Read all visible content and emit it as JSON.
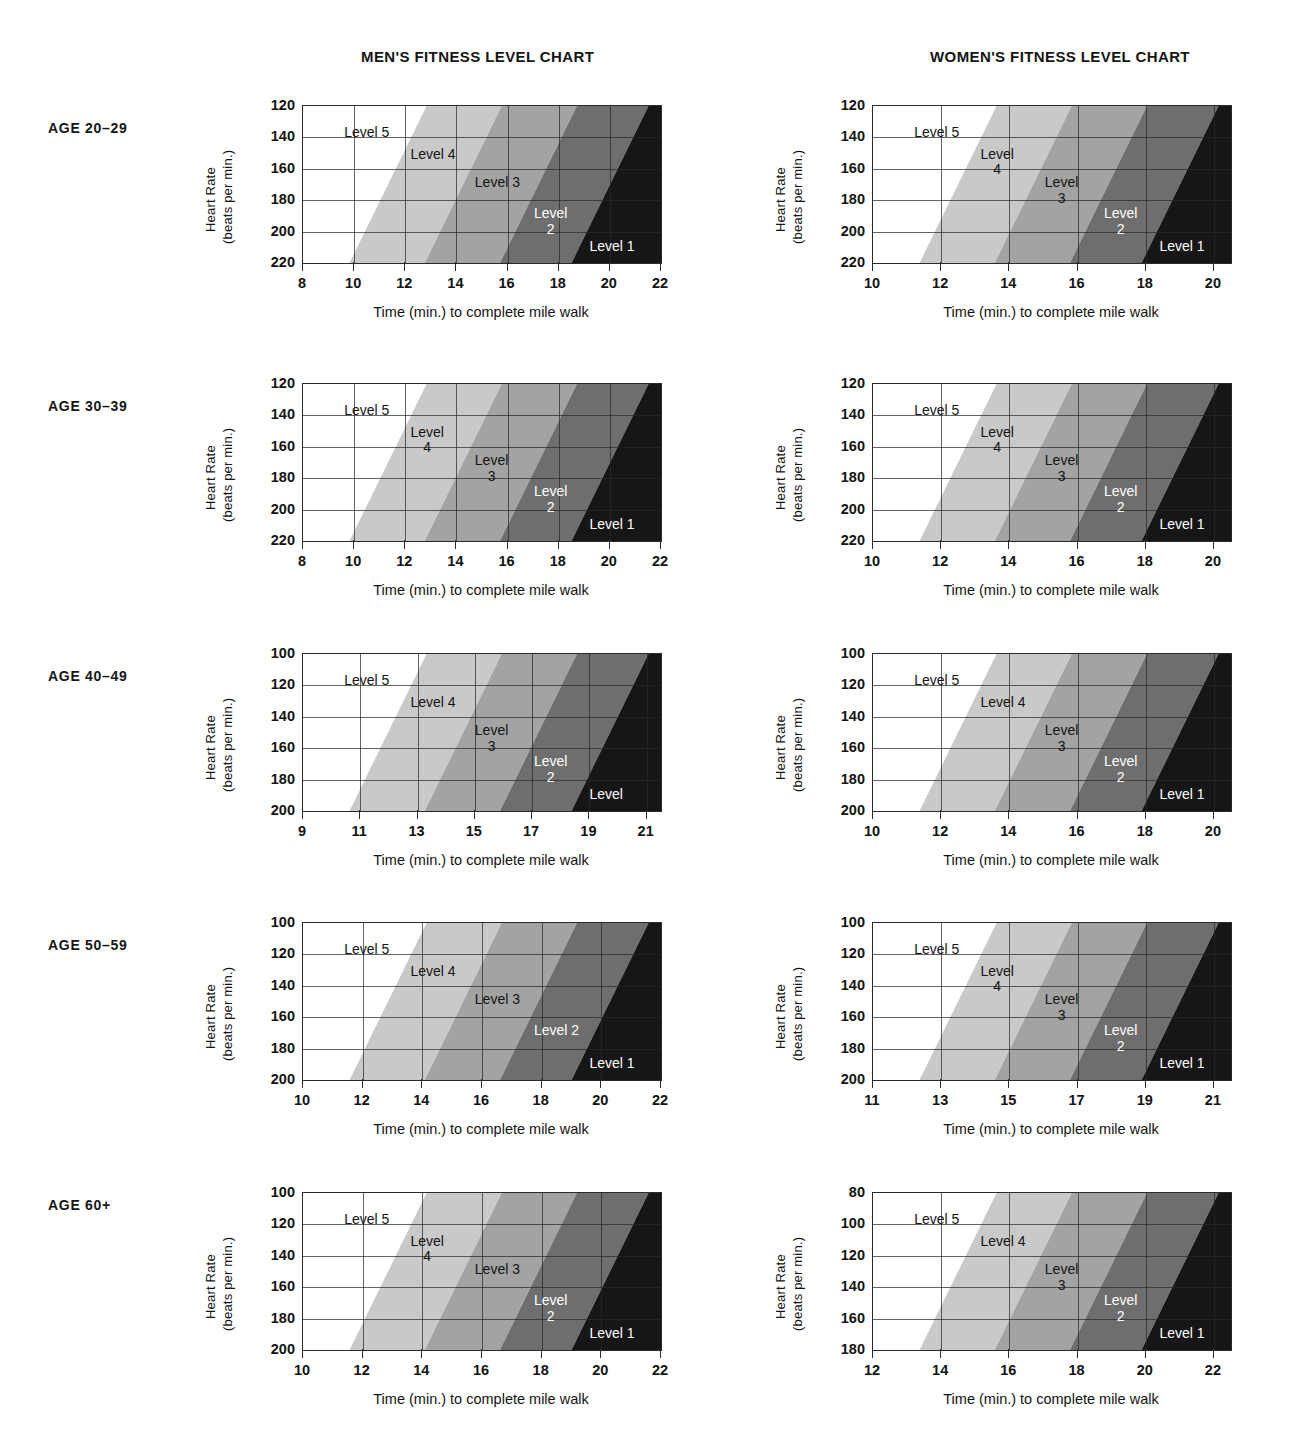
{
  "headers": {
    "men": "MEN'S FITNESS LEVEL CHART",
    "women": "WOMEN'S FITNESS LEVEL CHART"
  },
  "axis_titles": {
    "x": "Time (min.) to complete mile walk",
    "y_line1": "Heart Rate",
    "y_line2": "(beats per min.)"
  },
  "colors": {
    "level5": "#ffffff",
    "level4": "#c9c9c9",
    "level3": "#a3a3a3",
    "level2": "#6e6e6e",
    "level1": "#161616",
    "grid": "#2a2a2a",
    "text": "#131313"
  },
  "age_groups": [
    {
      "id": "age-20-29",
      "label": "AGE 20–29"
    },
    {
      "id": "age-30-39",
      "label": "AGE 30–39"
    },
    {
      "id": "age-40-49",
      "label": "AGE 40–49"
    },
    {
      "id": "age-50-59",
      "label": "AGE 50–59"
    },
    {
      "id": "age-60-plus",
      "label": "AGE 60+"
    }
  ],
  "level_labels": {
    "l5": "Level 5",
    "l4": "Level 4",
    "l3": "Level 3",
    "l2": "Level 2",
    "l1": "Level 1",
    "level_word": "Level",
    "n4": "4",
    "n3": "3",
    "n2": "2"
  },
  "chart_data": {
    "type": "area",
    "xlabel": "Time (min.) to complete mile walk",
    "ylabel": "Heart Rate (beats per min.)",
    "grid": true,
    "legend": "none",
    "band_order_left_to_right": [
      "Level 5",
      "Level 4",
      "Level 3",
      "Level 2",
      "Level 1"
    ],
    "band_colors": [
      "#ffffff",
      "#c9c9c9",
      "#a3a3a3",
      "#6e6e6e",
      "#161616"
    ],
    "charts": [
      {
        "sex": "men",
        "age_group": "AGE 20–29",
        "xticks": [
          8,
          10,
          12,
          14,
          16,
          18,
          20,
          22
        ],
        "xlim": [
          8,
          22
        ],
        "yticks": [
          120,
          140,
          160,
          180,
          200,
          220
        ],
        "ylim": [
          120,
          220
        ],
        "y_inverted": true,
        "labels": [
          {
            "text": "Level 5",
            "style": "one-line",
            "color": "dark"
          },
          {
            "text": "Level 4",
            "style": "one-line",
            "color": "dark"
          },
          {
            "text": "Level 3",
            "style": "one-line",
            "color": "dark"
          },
          {
            "text": "Level 2",
            "style": "two-line",
            "color": "light"
          },
          {
            "text": "Level 1",
            "style": "one-line",
            "color": "light"
          }
        ]
      },
      {
        "sex": "women",
        "age_group": "AGE 20–29",
        "xticks": [
          10,
          12,
          14,
          16,
          18,
          20
        ],
        "xlim": [
          10,
          20.5
        ],
        "yticks": [
          120,
          140,
          160,
          180,
          200,
          220
        ],
        "ylim": [
          120,
          220
        ],
        "y_inverted": true,
        "labels": [
          {
            "text": "Level 5",
            "style": "one-line",
            "color": "dark"
          },
          {
            "text": "Level 4",
            "style": "two-line",
            "color": "dark"
          },
          {
            "text": "Level 3",
            "style": "two-line",
            "color": "dark"
          },
          {
            "text": "Level 2",
            "style": "two-line",
            "color": "light"
          },
          {
            "text": "Level 1",
            "style": "one-line",
            "color": "light"
          }
        ]
      },
      {
        "sex": "men",
        "age_group": "AGE 30–39",
        "xticks": [
          8,
          10,
          12,
          14,
          16,
          18,
          20,
          22
        ],
        "xlim": [
          8,
          22
        ],
        "yticks": [
          120,
          140,
          160,
          180,
          200,
          220
        ],
        "ylim": [
          120,
          220
        ],
        "y_inverted": true,
        "labels": [
          {
            "text": "Level 5",
            "style": "one-line",
            "color": "dark"
          },
          {
            "text": "Level 4",
            "style": "two-line",
            "color": "dark"
          },
          {
            "text": "Level 3",
            "style": "two-line",
            "color": "dark"
          },
          {
            "text": "Level 2",
            "style": "two-line",
            "color": "light"
          },
          {
            "text": "Level 1",
            "style": "one-line",
            "color": "light"
          }
        ]
      },
      {
        "sex": "women",
        "age_group": "AGE 30–39",
        "xticks": [
          10,
          12,
          14,
          16,
          18,
          20
        ],
        "xlim": [
          10,
          20.5
        ],
        "yticks": [
          120,
          140,
          160,
          180,
          200,
          220
        ],
        "ylim": [
          120,
          220
        ],
        "y_inverted": true,
        "labels": [
          {
            "text": "Level 5",
            "style": "one-line",
            "color": "dark"
          },
          {
            "text": "Level 4",
            "style": "two-line",
            "color": "dark"
          },
          {
            "text": "Level 3",
            "style": "two-line",
            "color": "dark"
          },
          {
            "text": "Level 2",
            "style": "two-line",
            "color": "light"
          },
          {
            "text": "Level 1",
            "style": "one-line",
            "color": "light"
          }
        ]
      },
      {
        "sex": "men",
        "age_group": "AGE 40–49",
        "xticks": [
          9,
          11,
          13,
          15,
          17,
          19,
          21
        ],
        "xlim": [
          9,
          21.5
        ],
        "yticks": [
          100,
          120,
          140,
          160,
          180,
          200
        ],
        "ylim": [
          100,
          200
        ],
        "y_inverted": true,
        "labels": [
          {
            "text": "Level 5",
            "style": "one-line",
            "color": "dark"
          },
          {
            "text": "Level 4",
            "style": "one-line",
            "color": "dark"
          },
          {
            "text": "Level 3",
            "style": "two-line",
            "color": "dark"
          },
          {
            "text": "Level 2",
            "style": "two-line",
            "color": "light"
          },
          {
            "text": "Level",
            "style": "one-line",
            "color": "light"
          }
        ]
      },
      {
        "sex": "women",
        "age_group": "AGE 40–49",
        "xticks": [
          10,
          12,
          14,
          16,
          18,
          20
        ],
        "xlim": [
          10,
          20.5
        ],
        "yticks": [
          100,
          120,
          140,
          160,
          180,
          200
        ],
        "ylim": [
          100,
          200
        ],
        "y_inverted": true,
        "labels": [
          {
            "text": "Level 5",
            "style": "one-line",
            "color": "dark"
          },
          {
            "text": "Level 4",
            "style": "one-line",
            "color": "dark"
          },
          {
            "text": "Level 3",
            "style": "two-line",
            "color": "dark"
          },
          {
            "text": "Level 2",
            "style": "two-line",
            "color": "light"
          },
          {
            "text": "Level 1",
            "style": "one-line",
            "color": "light"
          }
        ]
      },
      {
        "sex": "men",
        "age_group": "AGE 50–59",
        "xticks": [
          10,
          12,
          14,
          16,
          18,
          20,
          22
        ],
        "xlim": [
          10,
          22
        ],
        "yticks": [
          100,
          120,
          140,
          160,
          180,
          200
        ],
        "ylim": [
          100,
          200
        ],
        "y_inverted": true,
        "labels": [
          {
            "text": "Level 5",
            "style": "one-line",
            "color": "dark"
          },
          {
            "text": "Level 4",
            "style": "one-line",
            "color": "dark"
          },
          {
            "text": "Level 3",
            "style": "one-line",
            "color": "dark"
          },
          {
            "text": "Level 2",
            "style": "one-line",
            "color": "light"
          },
          {
            "text": "Level 1",
            "style": "one-line",
            "color": "light"
          }
        ]
      },
      {
        "sex": "women",
        "age_group": "AGE 50–59",
        "xticks": [
          11,
          13,
          15,
          17,
          19,
          21
        ],
        "xlim": [
          11,
          21.5
        ],
        "yticks": [
          100,
          120,
          140,
          160,
          180,
          200
        ],
        "ylim": [
          100,
          200
        ],
        "y_inverted": true,
        "labels": [
          {
            "text": "Level 5",
            "style": "one-line",
            "color": "dark"
          },
          {
            "text": "Level 4",
            "style": "two-line",
            "color": "dark"
          },
          {
            "text": "Level 3",
            "style": "two-line",
            "color": "dark"
          },
          {
            "text": "Level 2",
            "style": "two-line",
            "color": "light"
          },
          {
            "text": "Level 1",
            "style": "one-line",
            "color": "light"
          }
        ]
      },
      {
        "sex": "men",
        "age_group": "AGE 60+",
        "xticks": [
          10,
          12,
          14,
          16,
          18,
          20,
          22
        ],
        "xlim": [
          10,
          22
        ],
        "yticks": [
          100,
          120,
          140,
          160,
          180,
          200
        ],
        "ylim": [
          100,
          200
        ],
        "y_inverted": true,
        "labels": [
          {
            "text": "Level 5",
            "style": "one-line",
            "color": "dark"
          },
          {
            "text": "Level 4",
            "style": "two-line",
            "color": "dark"
          },
          {
            "text": "Level 3",
            "style": "one-line",
            "color": "dark"
          },
          {
            "text": "Level 2",
            "style": "two-line",
            "color": "light"
          },
          {
            "text": "Level 1",
            "style": "one-line",
            "color": "light"
          }
        ]
      },
      {
        "sex": "women",
        "age_group": "AGE 60+",
        "xticks": [
          12,
          14,
          16,
          18,
          20,
          22
        ],
        "xlim": [
          12,
          22.5
        ],
        "yticks": [
          80,
          100,
          120,
          140,
          160,
          180
        ],
        "ylim": [
          80,
          180
        ],
        "y_inverted": true,
        "labels": [
          {
            "text": "Level 5",
            "style": "one-line",
            "color": "dark"
          },
          {
            "text": "Level 4",
            "style": "one-line",
            "color": "dark"
          },
          {
            "text": "Level 3",
            "style": "two-line",
            "color": "dark"
          },
          {
            "text": "Level 2",
            "style": "two-line",
            "color": "light"
          },
          {
            "text": "Level 1",
            "style": "one-line",
            "color": "light"
          }
        ]
      }
    ]
  },
  "layout": {
    "rows_y": [
      105,
      383,
      653,
      922,
      1192
    ],
    "men_x": 302,
    "women_x": 872,
    "plot_w": 358,
    "plot_h": 157,
    "age_label_y": [
      120,
      398,
      668,
      937,
      1197
    ]
  }
}
